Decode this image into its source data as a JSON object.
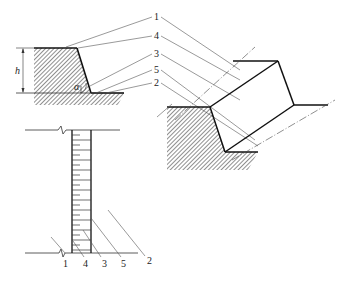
{
  "diagram": {
    "type": "engineering-slope-section",
    "colors": {
      "line": "#111111",
      "leader": "#555555",
      "hatch": "#333333",
      "background": "#ffffff"
    },
    "section_view": {
      "dimension_label": "h",
      "angle_label": "α",
      "callouts": [
        "1",
        "4",
        "3",
        "5",
        "2"
      ]
    },
    "plan_view": {
      "callouts": [
        "1",
        "4",
        "3",
        "5",
        "2"
      ]
    },
    "iso_view": {
      "description": "isometric slope block with centerlines"
    }
  }
}
